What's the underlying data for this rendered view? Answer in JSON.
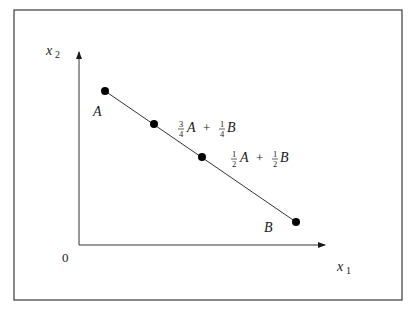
{
  "figure": {
    "axes": {
      "x_label": "x",
      "x_subscript": "1",
      "y_label": "x",
      "y_subscript": "2",
      "origin_label": "0"
    },
    "points": [
      {
        "id": "A",
        "label": "A"
      },
      {
        "id": "three-quarter",
        "coef_a_num": "3",
        "coef_a_den": "4",
        "a": "A",
        "plus": "+",
        "coef_b_num": "1",
        "coef_b_den": "4",
        "b": "B"
      },
      {
        "id": "midpoint",
        "coef_a_num": "1",
        "coef_a_den": "2",
        "a": "A",
        "plus": "+",
        "coef_b_num": "1",
        "coef_b_den": "2",
        "b": "B"
      },
      {
        "id": "B",
        "label": "B"
      }
    ],
    "colors": {
      "line": "#333333",
      "point": "#000000",
      "frame": "#555555"
    }
  }
}
